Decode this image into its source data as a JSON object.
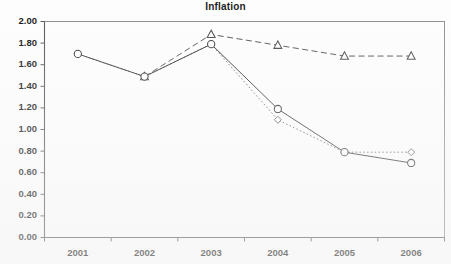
{
  "chart_data": {
    "type": "line",
    "title": "Inflation",
    "xlabel": "",
    "ylabel": "",
    "categories": [
      "2001",
      "2002",
      "2003",
      "2004",
      "2005",
      "2006"
    ],
    "ylim": [
      0.0,
      2.0
    ],
    "ytick_labels": [
      "0.00",
      "0.20",
      "0.40",
      "0.60",
      "0.80",
      "1.00",
      "1.20",
      "1.40",
      "1.60",
      "1.80",
      "2.00"
    ],
    "ytick_values": [
      0.0,
      0.2,
      0.4,
      0.6,
      0.8,
      1.0,
      1.2,
      1.4,
      1.6,
      1.8,
      2.0
    ],
    "grid": false,
    "legend": "none",
    "series": [
      {
        "name": "series-circle-solid",
        "marker": "circle",
        "line_style": "solid",
        "color": "#3a3a3a",
        "values": [
          1.7,
          1.49,
          1.79,
          1.19,
          0.79,
          0.69
        ]
      },
      {
        "name": "series-triangle-dashed",
        "marker": "triangle",
        "line_style": "dashed",
        "color": "#4a4a4a",
        "values": [
          null,
          1.49,
          1.88,
          1.78,
          1.68,
          1.68
        ]
      },
      {
        "name": "series-diamond-dotted",
        "marker": "diamond",
        "line_style": "dotted",
        "color": "#6a6a6a",
        "values": [
          1.7,
          1.49,
          1.79,
          1.09,
          0.79,
          0.79
        ]
      }
    ]
  },
  "axes": {
    "y_min_label": "0.00",
    "y_max_label": "2.00"
  }
}
